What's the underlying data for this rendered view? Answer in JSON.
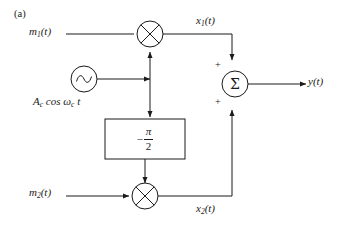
{
  "figure": {
    "caption": "(a)",
    "type": "qam-modulator-block-diagram"
  },
  "labels": {
    "m1": "m",
    "m1_sub": "1",
    "m1_arg": "(t)",
    "m2": "m",
    "m2_sub": "2",
    "m2_arg": "(t)",
    "x1": "x",
    "x1_sub": "1",
    "x1_arg": "(t)",
    "x2": "x",
    "x2_sub": "2",
    "x2_arg": "(t)",
    "y": "y",
    "y_arg": "(t)",
    "carrier_amp": "A",
    "carrier_amp_sub": "c",
    "carrier_cos": "cos",
    "carrier_omega": "ω",
    "carrier_omega_sub": "c",
    "carrier_time": "t"
  },
  "blocks": {
    "phase_shifter": {
      "minus": "−",
      "numerator": "π",
      "denominator": "2",
      "name": "minus-pi-over-two"
    },
    "summer": {
      "glyph": "Σ",
      "input_top_sign": "+",
      "input_bottom_sign": "+"
    },
    "multiplier_top": {
      "glyph": "⊗"
    },
    "multiplier_bottom": {
      "glyph": "⊗"
    },
    "oscillator": {
      "glyph": "sine-wave"
    }
  },
  "colors": {
    "line": "#1a1a1a",
    "text": "#1a1a1a",
    "background": "#ffffff"
  }
}
